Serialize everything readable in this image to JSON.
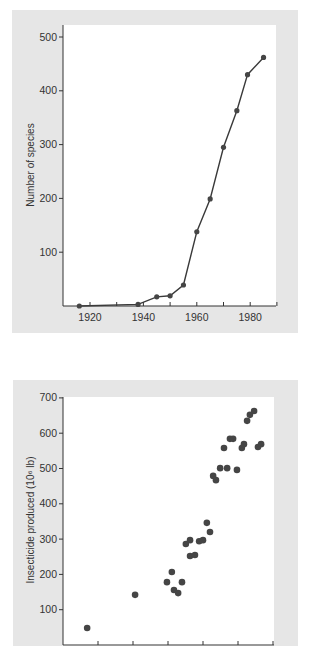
{
  "chart_data": [
    {
      "type": "line",
      "title": "",
      "xlabel": "",
      "ylabel": "Number of species",
      "xlim": [
        1910,
        1990
      ],
      "ylim": [
        0,
        520
      ],
      "x_ticks": [
        1920,
        1940,
        1960,
        1980
      ],
      "x_minor_ticks": [
        1930,
        1950,
        1970,
        1990
      ],
      "y_ticks": [
        100,
        200,
        300,
        400,
        500
      ],
      "grid": false,
      "legend": null,
      "markers": true,
      "series": [
        {
          "name": "Number of species",
          "x": [
            1916,
            1938,
            1945,
            1950,
            1955,
            1960,
            1965,
            1970,
            1975,
            1979,
            1985
          ],
          "y": [
            0,
            3,
            17,
            19,
            39,
            138,
            199,
            295,
            363,
            430,
            462
          ]
        }
      ]
    },
    {
      "type": "scatter",
      "title": "",
      "xlabel": "",
      "ylabel": "Insecticide produced (10⁶ lb)",
      "ylim": [
        0,
        700
      ],
      "y_ticks": [
        100,
        200,
        300,
        400,
        500,
        600,
        700
      ],
      "x_tick_count": 6,
      "x_tick_labels": [],
      "grid": false,
      "legend": null,
      "note": "x values given in tick-interval units from origin (no x tick labels visible)",
      "series": [
        {
          "name": "Insecticide produced",
          "x": [
            0.69,
            2.06,
            2.97,
            3.11,
            3.17,
            3.29,
            3.4,
            3.51,
            3.63,
            3.63,
            3.77,
            3.89,
            4.0,
            4.11,
            4.2,
            4.29,
            4.37,
            4.49,
            4.6,
            4.69,
            4.77,
            4.86,
            4.97,
            5.11,
            5.17,
            5.26,
            5.34,
            5.46,
            5.57,
            5.66
          ],
          "y": [
            48,
            142,
            178,
            207,
            156,
            147,
            178,
            286,
            297,
            252,
            255,
            294,
            297,
            346,
            320,
            479,
            467,
            501,
            558,
            501,
            584,
            584,
            496,
            558,
            569,
            635,
            652,
            663,
            561,
            569
          ]
        }
      ]
    }
  ],
  "charts": {
    "top": {
      "ylabel": "Number of species",
      "y_tick_labels": [
        "100",
        "200",
        "300",
        "400",
        "500"
      ],
      "x_tick_labels": [
        "1920",
        "1940",
        "1960",
        "1980"
      ]
    },
    "bottom": {
      "ylabel": "Insecticide produced (10⁶ lb)",
      "y_tick_labels": [
        "100",
        "200",
        "300",
        "400",
        "500",
        "600",
        "700"
      ]
    }
  },
  "colors": {
    "panel": "#e6e6e6",
    "plot": "#ffffff",
    "line": "#3a3a3a",
    "marker": "#454545",
    "text": "#333333"
  }
}
